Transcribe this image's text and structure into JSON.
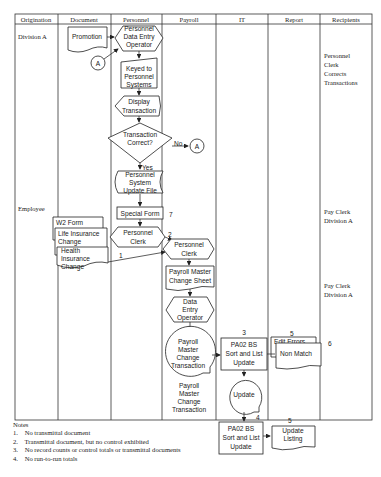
{
  "columns": [
    "Origination",
    "Document",
    "Personnel",
    "Payroll",
    "IT",
    "Report",
    "Recipients"
  ],
  "origination": {
    "division_a": "Division A",
    "employee": "Employee"
  },
  "recipients": {
    "r1": [
      "Personnel",
      "Clerk",
      "Corrects",
      "Transactions"
    ],
    "r2": [
      "Pay Clerk",
      "Division A"
    ],
    "r3": [
      "Pay Clerk",
      "Division A"
    ]
  },
  "shapes": {
    "promotion": "Promotion",
    "connector_a": "A",
    "connector_a2": "A",
    "data_entry_operator": [
      "Personnel",
      "Data Entry",
      "Operator"
    ],
    "keyed": [
      "Keyed to",
      "Personnel",
      "Systems"
    ],
    "display": [
      "Display",
      "Transaction"
    ],
    "decision": [
      "Transaction",
      "Correct?"
    ],
    "no_label": "No",
    "yes_label": "Yes",
    "update_file": [
      "Personnel",
      "System",
      "Update File"
    ],
    "special_form": "Special Form",
    "special_form_note": "7",
    "w2": "W2 Form",
    "life": [
      "Life Insurance",
      "Change"
    ],
    "health": [
      "Health",
      "Insurance",
      "Change"
    ],
    "personnel_clerk": [
      "Personnel",
      "Clerk"
    ],
    "personnel_clerk_note": "2",
    "payroll_personnel_clerk": [
      "Personnel",
      "Clerk"
    ],
    "arrow_note_1": "1",
    "payroll_master_sheet": [
      "Payroll Master",
      "Change Sheet"
    ],
    "payroll_data_entry": [
      "Data",
      "Entry",
      "Operator"
    ],
    "payroll_master_txn": [
      "Payroll",
      "Master",
      "Change",
      "Transaction"
    ],
    "payroll_master_txn_label": [
      "Payroll",
      "Master",
      "Change",
      "Transaction"
    ],
    "pa02_1": [
      "PA02 BS",
      "Sort and List",
      "Update"
    ],
    "pa02_1_note": "3",
    "edit_errors": "Edit Errors",
    "non_match": "Non Match",
    "edit_errors_note": "5",
    "report_note_6": "6",
    "update_disk": "Update",
    "update_disk_note": "4",
    "pa02_2": [
      "PA02 BS",
      "Sort and List",
      "Update"
    ],
    "update_listing": [
      "Update",
      "Listing"
    ],
    "update_listing_note": "5"
  },
  "notes": {
    "title": "Notes",
    "items": [
      {
        "num": "1.",
        "text": "No transmittal document"
      },
      {
        "num": "2.",
        "text": "Transmittal document, but no control exhibited"
      },
      {
        "num": "3.",
        "text": "No record counts or control totals or transmittal documents"
      },
      {
        "num": "4.",
        "text": "No run-to-run totals"
      }
    ]
  }
}
